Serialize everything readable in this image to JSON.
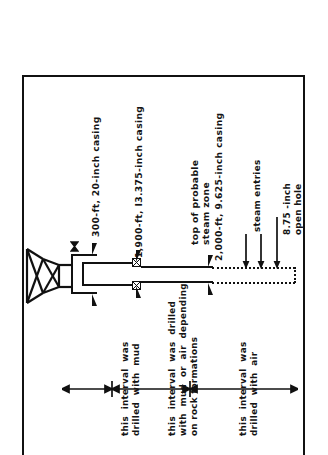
{
  "figure": {
    "orientation": "rotated-90-ccw",
    "frame_color": "#111111",
    "background": "#ffffff"
  },
  "annotations": {
    "wellhead_valve": "valve-symbol",
    "surface_casing": "300-ft, 20-inch casing",
    "intermediate_casing": "1,900-ft, I3.375-inch casing",
    "steam_zone_line1": "top of probable",
    "steam_zone_line2": "steam zone",
    "production_casing": "2,000-ft, 9.625-inch casing",
    "steam_entries": "steam entries",
    "open_hole_line1": "8.75 -inch",
    "open_hole_line2": "open hole"
  },
  "intervals": [
    {
      "id": "interval-mud",
      "line1": "this  interval  was",
      "line2": "drilled  with  mud"
    },
    {
      "id": "interval-mud-or-air",
      "line1": "this  interval  was  drilled",
      "line2": "with  mud  or  air  depending",
      "line3": "on rock formations"
    },
    {
      "id": "interval-air",
      "line1": "this  interval  was",
      "line2": "drilled  with  air"
    }
  ],
  "well_schematic": {
    "derrick_label": "drilling-derrick",
    "casing_strings": 3,
    "open_hole_style": "dotted",
    "shoe_markers": 4,
    "hanger_blocks": 2,
    "steam_entry_arrows": 2,
    "open_hole_arrow": 1
  }
}
